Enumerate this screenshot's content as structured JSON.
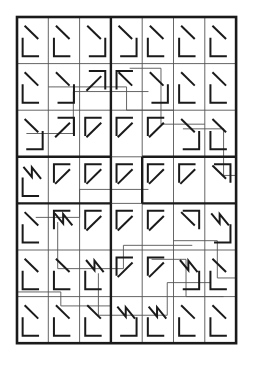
{
  "figure": {
    "background_color": "#ffffff",
    "ink_color": "#1a1a1a",
    "thin_line_color": "#555555"
  },
  "canvas": {
    "width": 253,
    "height": 369
  },
  "grid": {
    "origin_x": 17,
    "origin_y": 17,
    "columns": 7,
    "rows": 7,
    "cell_width": 31.3,
    "cell_height": 46.6,
    "outer_border_width": 2.6,
    "cell_line_width": 0.9,
    "block_line_width": 2.4,
    "overlay_line_width": 0.9
  },
  "legend": {
    "corner_bottom_left": "corner-bl",
    "corner_top_left": "corner-tl",
    "corner_top_right": "corner-tr",
    "corner_bottom_right": "corner-br",
    "diagonal_down_right": "diag-dr",
    "diagonal_up_right": "diag-ur",
    "zigzag": "zigzag"
  },
  "cells": [
    [
      {
        "corner": "corner-bl",
        "marks": [
          "diag-dr"
        ]
      },
      {
        "corner": "corner-bl",
        "marks": [
          "diag-dr"
        ]
      },
      {
        "corner": "corner-br",
        "marks": [
          "diag-dr"
        ]
      },
      {
        "corner": "corner-br",
        "marks": [
          "diag-dr"
        ]
      },
      {
        "corner": "corner-bl",
        "marks": [
          "diag-dr"
        ]
      },
      {
        "corner": "corner-bl",
        "marks": [
          "diag-dr"
        ]
      },
      {
        "corner": "corner-bl",
        "marks": [
          "diag-dr"
        ]
      }
    ],
    [
      {
        "corner": "corner-bl",
        "marks": [
          "diag-dr"
        ]
      },
      {
        "corner": "corner-br",
        "marks": [
          "diag-dr"
        ]
      },
      {
        "corner": "corner-tr",
        "marks": [
          "diag-ur"
        ]
      },
      {
        "corner": "corner-tl",
        "marks": [
          "diag-dr"
        ]
      },
      {
        "corner": "corner-br",
        "marks": [
          "diag-dr"
        ]
      },
      {
        "corner": "corner-bl",
        "marks": [
          "diag-dr"
        ]
      },
      {
        "corner": "corner-bl",
        "marks": [
          "diag-dr"
        ]
      }
    ],
    [
      {
        "corner": "corner-br",
        "marks": [
          "diag-dr"
        ]
      },
      {
        "corner": "corner-tr",
        "marks": [
          "diag-ur"
        ]
      },
      {
        "corner": "corner-tl",
        "marks": [
          "diag-ur"
        ]
      },
      {
        "corner": "corner-tl",
        "marks": [
          "diag-ur"
        ]
      },
      {
        "corner": "corner-tl",
        "marks": [
          "diag-ur"
        ]
      },
      {
        "corner": "corner-br",
        "marks": [
          "diag-dr"
        ]
      },
      {
        "corner": "corner-bl",
        "marks": [
          "diag-dr"
        ]
      }
    ],
    [
      {
        "corner": "corner-bl",
        "marks": [
          "zigzag"
        ]
      },
      {
        "corner": "corner-tl",
        "marks": [
          "diag-ur"
        ]
      },
      {
        "corner": "corner-tl",
        "marks": [
          "diag-ur"
        ]
      },
      {
        "corner": "corner-tl",
        "marks": [
          "diag-ur"
        ]
      },
      {
        "corner": "corner-tl",
        "marks": [
          "diag-ur"
        ]
      },
      {
        "corner": "corner-tl",
        "marks": [
          "diag-ur"
        ]
      },
      {
        "corner": "corner-tr",
        "marks": [
          "diag-dr"
        ]
      }
    ],
    [
      {
        "corner": "corner-bl",
        "marks": [
          "diag-dr"
        ]
      },
      {
        "corner": "corner-tl",
        "marks": [
          "zigzag"
        ]
      },
      {
        "corner": "corner-tl",
        "marks": [
          "diag-ur"
        ]
      },
      {
        "corner": "corner-tl",
        "marks": [
          "diag-ur"
        ]
      },
      {
        "corner": "corner-tl",
        "marks": [
          "diag-ur"
        ]
      },
      {
        "corner": "corner-tr",
        "marks": [
          "diag-dr"
        ]
      },
      {
        "corner": "corner-br",
        "marks": [
          "zigzag"
        ]
      }
    ],
    [
      {
        "corner": "corner-bl",
        "marks": [
          "diag-dr"
        ]
      },
      {
        "corner": "corner-bl",
        "marks": [
          "diag-dr"
        ]
      },
      {
        "corner": "corner-bl",
        "marks": [
          "zigzag"
        ]
      },
      {
        "corner": "corner-tl",
        "marks": [
          "diag-ur"
        ]
      },
      {
        "corner": "corner-tl",
        "marks": [
          "diag-ur"
        ]
      },
      {
        "corner": "corner-br",
        "marks": [
          "zigzag"
        ]
      },
      {
        "corner": "corner-bl",
        "marks": [
          "diag-dr"
        ]
      }
    ],
    [
      {
        "corner": "corner-bl",
        "marks": [
          "diag-dr"
        ]
      },
      {
        "corner": "corner-bl",
        "marks": [
          "diag-dr"
        ]
      },
      {
        "corner": "corner-bl",
        "marks": [
          "diag-dr"
        ]
      },
      {
        "corner": "corner-br",
        "marks": [
          "zigzag"
        ]
      },
      {
        "corner": "corner-bl",
        "marks": [
          "zigzag"
        ]
      },
      {
        "corner": "corner-bl",
        "marks": [
          "diag-dr"
        ]
      },
      {
        "corner": "corner-bl",
        "marks": [
          "diag-dr"
        ]
      }
    ]
  ],
  "block_dividers": {
    "vertical": [
      {
        "col": 3,
        "row_start": 0,
        "row_end": 3
      },
      {
        "col": 3,
        "row_start": 3,
        "row_end": 4
      },
      {
        "col": 4,
        "row_start": 3,
        "row_end": 4
      },
      {
        "col": 3,
        "row_start": 4,
        "row_end": 7
      }
    ],
    "horizontal": [
      {
        "row": 3,
        "col_start": 0,
        "col_end": 3
      },
      {
        "row": 3,
        "col_start": 4,
        "col_end": 7
      },
      {
        "row": 4,
        "col_start": 0,
        "col_end": 3
      },
      {
        "row": 4,
        "col_start": 4,
        "col_end": 7
      }
    ]
  },
  "overlay_paths": [
    {
      "id": "path-1",
      "points": [
        [
          1,
          1.5
        ],
        [
          3.5,
          1.5
        ],
        [
          3.5,
          2.0
        ],
        [
          5.0,
          2.0
        ]
      ]
    },
    {
      "id": "path-2",
      "points": [
        [
          0.3,
          2.5
        ],
        [
          1.8,
          2.5
        ],
        [
          1.8,
          1.6
        ],
        [
          4.2,
          1.6
        ]
      ]
    },
    {
      "id": "path-3",
      "points": [
        [
          3.6,
          1.1
        ],
        [
          4.6,
          1.1
        ],
        [
          4.6,
          2.3
        ],
        [
          6.0,
          2.3
        ]
      ]
    },
    {
      "id": "path-4",
      "points": [
        [
          5.3,
          2.4
        ],
        [
          6.6,
          2.4
        ],
        [
          6.6,
          3.4
        ],
        [
          7.0,
          3.4
        ]
      ]
    },
    {
      "id": "path-5",
      "points": [
        [
          0.6,
          4.3
        ],
        [
          2.0,
          4.3
        ],
        [
          2.0,
          3.7
        ],
        [
          4.2,
          3.7
        ]
      ]
    },
    {
      "id": "path-6",
      "points": [
        [
          1.3,
          4.4
        ],
        [
          1.3,
          5.4
        ],
        [
          3.4,
          5.4
        ],
        [
          3.4,
          4.9
        ],
        [
          5.6,
          4.9
        ]
      ]
    },
    {
      "id": "path-7",
      "points": [
        [
          5.0,
          4.8
        ],
        [
          6.4,
          4.8
        ],
        [
          6.4,
          5.6
        ],
        [
          7.0,
          5.6
        ]
      ]
    },
    {
      "id": "path-8",
      "points": [
        [
          2.6,
          5.5
        ],
        [
          2.6,
          6.4
        ],
        [
          4.8,
          6.4
        ],
        [
          4.8,
          5.7
        ],
        [
          6.2,
          5.7
        ]
      ]
    },
    {
      "id": "path-9",
      "points": [
        [
          0.0,
          5.9
        ],
        [
          1.4,
          5.9
        ],
        [
          1.4,
          6.2
        ],
        [
          3.0,
          6.2
        ]
      ]
    },
    {
      "id": "path-10",
      "points": [
        [
          4.3,
          5.2
        ],
        [
          5.4,
          5.2
        ],
        [
          5.4,
          6.0
        ],
        [
          6.6,
          6.0
        ]
      ]
    }
  ]
}
